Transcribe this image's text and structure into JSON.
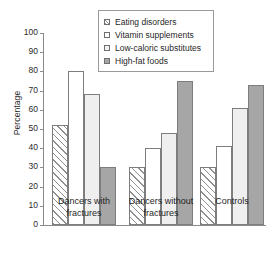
{
  "chart_data": {
    "type": "bar",
    "title": "",
    "xlabel": "",
    "ylabel": "Percentage",
    "ylim": [
      0,
      100
    ],
    "ytick_step": 10,
    "yticks": [
      100,
      90,
      80,
      70,
      60,
      50,
      40,
      30,
      20,
      10,
      0
    ],
    "grid": false,
    "legend_position": "top-center",
    "categories": [
      "Dancers with\nfractures",
      "Dancers without\nfractures",
      "Controls"
    ],
    "series": [
      {
        "name": "Eating disorders",
        "swatch": "hatch",
        "color": "#ffffff",
        "values": [
          52,
          30,
          30
        ]
      },
      {
        "name": "Vitamin supplements",
        "swatch": "white",
        "color": "#ffffff",
        "values": [
          80,
          40,
          41
        ]
      },
      {
        "name": "Low-caloric substitutes",
        "swatch": "light",
        "color": "#efefef",
        "values": [
          68,
          48,
          61
        ]
      },
      {
        "name": "High-fat foods",
        "swatch": "dark",
        "color": "#a6a6a6",
        "values": [
          30,
          75,
          73
        ]
      }
    ]
  },
  "axis": {
    "y_title": "Percentage"
  },
  "legend": {
    "items": [
      {
        "label": "Eating disorders"
      },
      {
        "label": "Vitamin supplements"
      },
      {
        "label": "Low-caloric substitutes"
      },
      {
        "label": "High-fat foods"
      }
    ]
  },
  "colors": {
    "axis": "#8a8a8a",
    "bar_outline": "#7d7d7d",
    "hatch_stroke": "#8f8f8f",
    "light_gray": "#efefef",
    "dark_gray": "#a6a6a6",
    "text": "#1f1f1f",
    "background": "#ffffff"
  }
}
